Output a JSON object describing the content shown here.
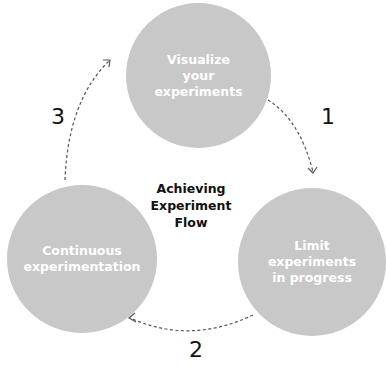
{
  "diagram": {
    "title": [
      "Achieving",
      "Experiment",
      "Flow"
    ],
    "colors": {
      "circle": "#c8c8c8",
      "circle_text": "#ffffff",
      "arrow": "#555555",
      "text": "#111111"
    },
    "nodes": [
      {
        "id": "top",
        "lines": [
          "Visualize",
          "your",
          "experiments"
        ]
      },
      {
        "id": "right",
        "lines": [
          "Limit",
          "experiments",
          "in progress"
        ]
      },
      {
        "id": "left",
        "lines": [
          "Continuous",
          "experimentation"
        ]
      }
    ],
    "steps": [
      {
        "label": "1",
        "from": "top",
        "to": "right"
      },
      {
        "label": "2",
        "from": "right",
        "to": "left"
      },
      {
        "label": "3",
        "from": "left",
        "to": "top"
      }
    ]
  }
}
